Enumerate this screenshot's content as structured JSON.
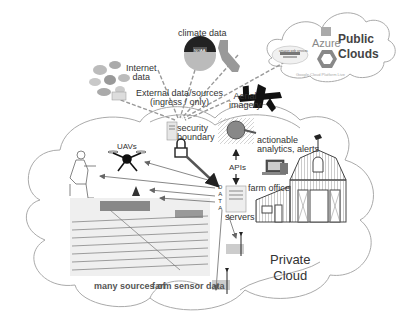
{
  "diagram": {
    "labels": {
      "internet_data": "Internet\ndata",
      "climate_data": "climate data",
      "external_sources_line1": "External data/sources",
      "external_sources_line2": "(ingress / only)",
      "public_clouds_line1": "Public",
      "public_clouds_line2": "Clouds",
      "azure": "Azure",
      "amazon": "amazon web services",
      "google": "Google Cloud Platform Live",
      "aerial_line1": "Aerial",
      "aerial_line2": "imagery",
      "security_line1": "security",
      "security_line2": "boundary",
      "actionable_line1": "actionable",
      "actionable_line2": "analytics, alerts",
      "apis": "APIs",
      "farm_office": "farm office",
      "data_vertical": [
        "D",
        "A",
        "T",
        "A"
      ],
      "servers": "servers",
      "uavs": "UAVs",
      "private_line1": "Private",
      "private_line2": "Cloud",
      "sensor_left": "many sources of",
      "sensor_right": "farm sensor data",
      "noaa": "NOAA"
    },
    "icons": [
      "internet-globes-icon",
      "noaa-logo-icon",
      "california-map-icon",
      "amazon-aws-logo-icon",
      "azure-logo-icon",
      "google-cloud-logo-icon",
      "airplane-icon",
      "server-icon",
      "padlock-icon",
      "magnifier-globe-icon",
      "laptop-icon",
      "barn-icon",
      "weathervane-icon",
      "drone-icon",
      "farmer-icon",
      "irrigation-field-map-icon",
      "soil-sensor-icon"
    ],
    "colors": {
      "line": "#999999",
      "dark": "#111111",
      "text": "#333333",
      "arrow": "#666666"
    }
  }
}
